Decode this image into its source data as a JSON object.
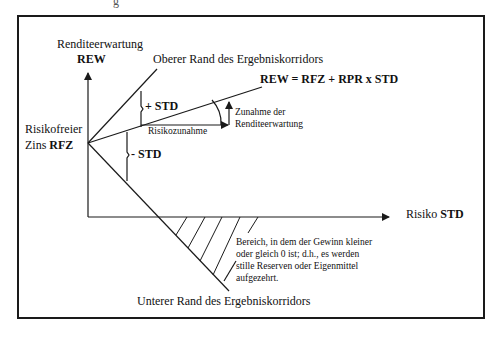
{
  "top_fragment": "g",
  "y_axis": {
    "label": "Renditeerwartung",
    "symbol": "REW"
  },
  "x_axis": {
    "label": "Risiko",
    "symbol": "STD"
  },
  "origin": {
    "label_line1": "Risikofreier",
    "label_line2_prefix": "Zins",
    "symbol": "RFZ"
  },
  "upper_edge_label": "Oberer Rand des Ergebniskorridors",
  "lower_edge_label": "Unterer Rand des Ergebniskorridors",
  "formula": "REW = RFZ + RPR x STD",
  "plus_std": "+ STD",
  "minus_std": "- STD",
  "risk_increase": "Risikozunahme",
  "return_increase": {
    "line1": "Zunahme der",
    "line2": "Renditeerwartung"
  },
  "hatched_area_note": {
    "line1": "Bereich, in dem der Gewinn  kleiner",
    "line2": "oder gleich 0 ist; d.h., es werden",
    "line3": "stille Reserven oder Eigenmittel",
    "line4": "aufgezehrt."
  },
  "colors": {
    "line": "#1a1a1a",
    "background": "#ffffff"
  }
}
